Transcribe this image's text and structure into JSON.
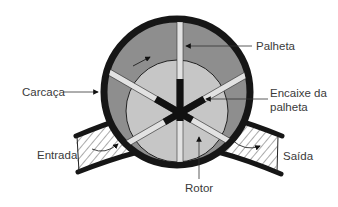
{
  "diagram": {
    "type": "cross-section",
    "labels": {
      "casing": "Carcaça",
      "vane": "Palheta",
      "vane_slot_line1": "Encaixe da",
      "vane_slot_line2": "palheta",
      "inlet": "Entrada",
      "outlet": "Saída",
      "rotor": "Rotor"
    },
    "colors": {
      "casing": "#161616",
      "chamber": "#8e8e8e",
      "rotor": "#c6c6c6",
      "vane": "#e2e2e2",
      "slot": "#111111",
      "hatch": "#555555",
      "text": "#3a3a3a",
      "background": "#ffffff"
    },
    "vane_count": 6
  }
}
